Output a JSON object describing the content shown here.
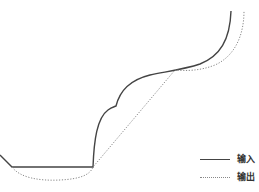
{
  "chart_data": {
    "type": "line",
    "title": "",
    "xlabel": "",
    "ylabel": "",
    "grid": false,
    "axes_visible": false,
    "legend_position": "bottom-right",
    "series": [
      {
        "name": "输入",
        "style": "solid",
        "color": "#444444",
        "path": "M 0 155 L 12 167 L 93 167 C 94 140, 97 118, 108 110 C 112 107, 114 107, 116 106 C 120 90, 130 80, 150 75 C 170 71, 185 69, 200 64 C 220 56, 230 40, 231 11",
        "points": [
          [
            0,
            155
          ],
          [
            12,
            167
          ],
          [
            93,
            167
          ],
          [
            108,
            110
          ],
          [
            116,
            106
          ],
          [
            150,
            75
          ],
          [
            200,
            64
          ],
          [
            231,
            11
          ]
        ]
      },
      {
        "name": "输出",
        "style": "dotted",
        "color": "#888888",
        "path": "M 12 167 C 20 178, 40 181, 60 180 C 80 179, 90 175, 93 167 L 175 70 C 185 71, 200 71, 215 65 C 235 56, 244 35, 244 11",
        "points": [
          [
            12,
            167
          ],
          [
            60,
            180
          ],
          [
            93,
            167
          ],
          [
            175,
            70
          ],
          [
            215,
            65
          ],
          [
            244,
            11
          ]
        ]
      }
    ]
  },
  "legend": {
    "items": [
      {
        "label": "输入",
        "style": "solid"
      },
      {
        "label": "输出",
        "style": "dotted"
      }
    ]
  }
}
